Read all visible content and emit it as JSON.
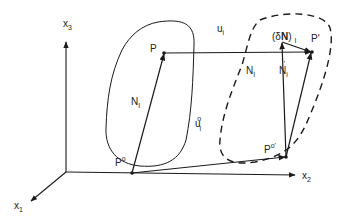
{
  "figure": {
    "type": "continuum deformation kinematics diagram",
    "colors": {
      "ink": "#1a1a1a",
      "background": "#ffffff"
    },
    "axes": {
      "x1": {
        "label": "x",
        "subscript": "1"
      },
      "x2": {
        "label": "x",
        "subscript": "2"
      },
      "x3": {
        "label": "x",
        "subscript": "3"
      }
    },
    "points": {
      "P": {
        "label": "P"
      },
      "P0": {
        "label": "P",
        "superscript": "o"
      },
      "Pprime": {
        "label": "P'"
      },
      "P0prime": {
        "label": "P",
        "superscript": "o'"
      }
    },
    "vectors": {
      "N_ref": {
        "label": "N",
        "subscript": "I"
      },
      "N_cur": {
        "label": "N",
        "subscript": "I"
      },
      "N_prime": {
        "label": "N",
        "subscript": "i",
        "prime": "'"
      },
      "u": {
        "label": "u",
        "subscript": "i"
      },
      "u0": {
        "label": "u",
        "subscript": "i",
        "superscript": "o"
      },
      "deltaN": {
        "prefix": "(δ",
        "bold": "N",
        "suffix": ")",
        "subscript": "I"
      }
    },
    "regions": {
      "reference": {
        "style": "solid"
      },
      "deformed": {
        "style": "dashed"
      }
    }
  }
}
